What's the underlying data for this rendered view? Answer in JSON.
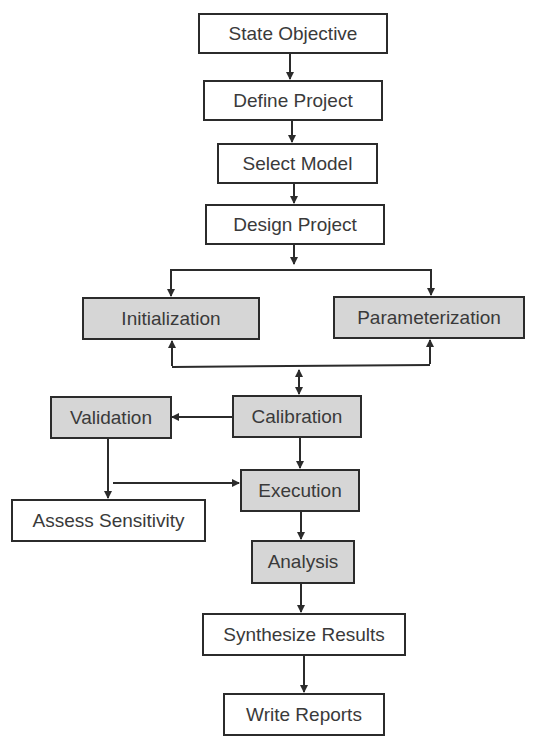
{
  "diagram": {
    "type": "flowchart",
    "colors": {
      "box_border": "#2b2b2b",
      "white_box_fill": "#ffffff",
      "gray_box_fill": "#d6d6d6",
      "text": "#3a3a3a",
      "arrow": "#2b2b2b"
    },
    "nodes": {
      "state_objective": "State Objective",
      "define_project": "Define Project",
      "select_model": "Select Model",
      "design_project": "Design Project",
      "initialization": "Initialization",
      "parameterization": "Parameterization",
      "calibration": "Calibration",
      "validation": "Validation",
      "execution": "Execution",
      "assess_sensitivity": "Assess Sensitivity",
      "analysis": "Analysis",
      "synthesize_results": "Synthesize Results",
      "write_reports": "Write Reports"
    },
    "edges": [
      {
        "from": "State Objective",
        "to": "Define Project"
      },
      {
        "from": "Define Project",
        "to": "Select Model"
      },
      {
        "from": "Select Model",
        "to": "Design Project"
      },
      {
        "from": "Design Project",
        "to": "Initialization"
      },
      {
        "from": "Design Project",
        "to": "Parameterization"
      },
      {
        "from": "Initialization",
        "to": "Calibration",
        "bidirectional": true
      },
      {
        "from": "Parameterization",
        "to": "Calibration",
        "bidirectional": true
      },
      {
        "from": "Calibration",
        "to": "Validation"
      },
      {
        "from": "Calibration",
        "to": "Execution"
      },
      {
        "from": "Validation",
        "to": "Assess Sensitivity"
      },
      {
        "from": "Validation",
        "to": "Execution"
      },
      {
        "from": "Execution",
        "to": "Analysis"
      },
      {
        "from": "Analysis",
        "to": "Synthesize Results"
      },
      {
        "from": "Synthesize Results",
        "to": "Write Reports"
      }
    ]
  }
}
